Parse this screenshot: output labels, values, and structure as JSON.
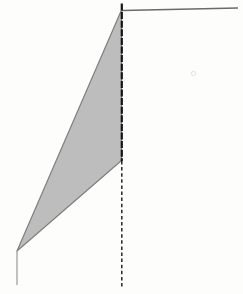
{
  "canvas": {
    "width": 243,
    "height": 294,
    "background": "#fdfdfc"
  },
  "colors": {
    "triangle_fill": "#bdbdbd",
    "triangle_edge": "#7f7f7f",
    "wall_line_dark": "#141414",
    "wall_line_dashed": "#262626",
    "top_line_gray": "#6a6a6a",
    "thin_line_gray": "#9a9a9a",
    "smudge_gray": "#e9e9e9"
  },
  "diagram": {
    "shapes": [
      {
        "name": "shaded-triangle",
        "type": "polygon",
        "points": [
          [
            121.5,
            10
          ],
          [
            121.5,
            160.5
          ],
          [
            17,
            251
          ]
        ],
        "fill": "#bdbdbd",
        "stroke": "#7f7f7f",
        "strokeWidth": 1.2
      },
      {
        "name": "top-horizontal-line",
        "type": "line",
        "x1": 122,
        "y1": 10.5,
        "x2": 238,
        "y2": 8,
        "stroke": "#6a6a6a",
        "strokeWidth": 1.5
      },
      {
        "name": "vertical-line-upper-solid",
        "type": "line",
        "x1": 121.8,
        "y1": 3.5,
        "x2": 121.8,
        "y2": 161,
        "stroke": "#141414",
        "strokeWidth": 2.2,
        "dash": "7,1.6"
      },
      {
        "name": "vertical-line-lower-dashed",
        "type": "line",
        "x1": 121.8,
        "y1": 161,
        "x2": 121.8,
        "y2": 288,
        "stroke": "#262626",
        "strokeWidth": 1.5,
        "dash": "3.5,2.6"
      },
      {
        "name": "bottom-left-vertical-line",
        "type": "line",
        "x1": 17,
        "y1": 251,
        "x2": 17,
        "y2": 285,
        "stroke": "#9a9a9a",
        "strokeWidth": 1.2
      },
      {
        "name": "scan-smudge",
        "type": "circle",
        "cx": 193.5,
        "cy": 73.5,
        "r": 2.2,
        "fill": "none",
        "stroke": "#e2e2e2",
        "strokeWidth": 1
      }
    ]
  }
}
